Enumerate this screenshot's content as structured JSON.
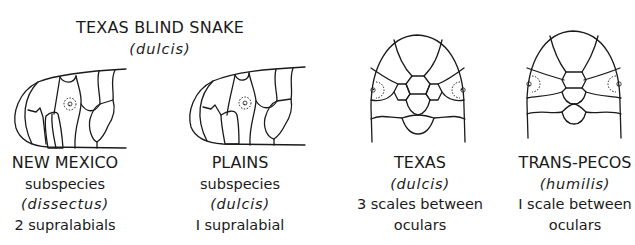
{
  "title": {
    "common_name": "TEXAS BLIND SNAKE",
    "species": "(dulcis)"
  },
  "figures": [
    {
      "view": "side",
      "region": "NEW MEXICO",
      "line2": "subspecies",
      "taxon": "(dissectus)",
      "trait": "2 supralabials",
      "trait_line2": ""
    },
    {
      "view": "side",
      "region": "PLAINS",
      "line2": "subspecies",
      "taxon": "(dulcis)",
      "trait": "I supralabial",
      "trait_line2": ""
    },
    {
      "view": "top",
      "region": "TEXAS",
      "line2": "",
      "taxon": "(dulcis)",
      "trait": "3 scales between",
      "trait_line2": "oculars"
    },
    {
      "view": "top",
      "region": "TRANS-PECOS",
      "line2": "",
      "taxon": "(humilis)",
      "trait": "I scale between",
      "trait_line2": "oculars"
    }
  ],
  "colors": {
    "ink": "#1a1a1a",
    "background": "#ffffff"
  }
}
